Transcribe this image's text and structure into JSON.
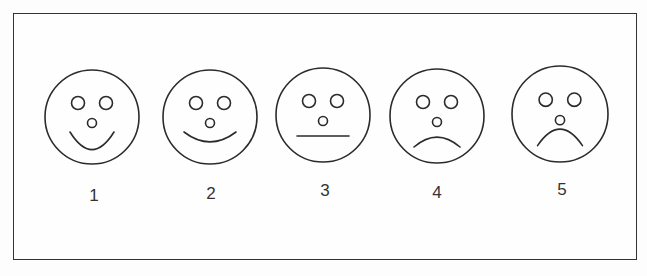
{
  "figure": {
    "type": "faces-rating-scale",
    "frame": {
      "x": 13,
      "y": 13,
      "width": 624,
      "height": 247,
      "border_color": "#333333"
    },
    "stroke_color": "#2b2b2b",
    "faces": [
      {
        "label": "1",
        "expression": "big-smile",
        "cx": 92,
        "cy": 117,
        "r": 47,
        "label_x": 94,
        "label_y": 186,
        "mouth_curve": 16
      },
      {
        "label": "2",
        "expression": "smile",
        "cx": 210,
        "cy": 117,
        "r": 47,
        "label_x": 211,
        "label_y": 184,
        "mouth_curve": 9
      },
      {
        "label": "3",
        "expression": "neutral",
        "cx": 323,
        "cy": 115,
        "r": 47,
        "label_x": 325,
        "label_y": 181,
        "mouth_curve": 0
      },
      {
        "label": "4",
        "expression": "frown",
        "cx": 437,
        "cy": 116,
        "r": 47,
        "label_x": 437,
        "label_y": 183,
        "mouth_curve": -9
      },
      {
        "label": "5",
        "expression": "big-frown",
        "cx": 560,
        "cy": 114,
        "r": 48,
        "label_x": 562,
        "label_y": 180,
        "mouth_curve": -15
      }
    ]
  }
}
